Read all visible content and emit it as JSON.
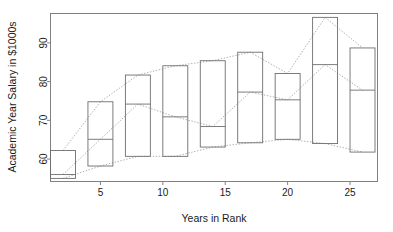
{
  "chart_data": {
    "type": "box",
    "title": "",
    "xlabel": "Years in Rank",
    "ylabel": "Academic Year Salary in $1000s",
    "xlim": [
      1,
      27.2
    ],
    "ylim": [
      54.2,
      97.6
    ],
    "xticks": [
      5,
      10,
      15,
      20,
      25
    ],
    "xtick_labels": [
      "5",
      "10",
      "15",
      "20",
      "25"
    ],
    "yticks": [
      60,
      70,
      80,
      90
    ],
    "ytick_labels": [
      "60",
      "70",
      "80",
      "90"
    ],
    "grid": false,
    "legend": "none",
    "box_width": 2.0,
    "boxes": [
      {
        "x": 2.0,
        "low": 55.0,
        "median": 56.0,
        "high": 62.2
      },
      {
        "x": 5.0,
        "low": 58.2,
        "median": 65.1,
        "high": 74.8
      },
      {
        "x": 8.0,
        "low": 60.7,
        "median": 74.2,
        "high": 81.7
      },
      {
        "x": 11.0,
        "low": 60.7,
        "median": 70.9,
        "high": 84.1
      },
      {
        "x": 14.0,
        "low": 63.1,
        "median": 68.4,
        "high": 85.4
      },
      {
        "x": 17.0,
        "low": 64.2,
        "median": 77.3,
        "high": 87.6
      },
      {
        "x": 20.0,
        "low": 65.1,
        "median": 75.3,
        "high": 82.1
      },
      {
        "x": 23.0,
        "low": 64.0,
        "median": 84.4,
        "high": 96.6
      },
      {
        "x": 26.0,
        "low": 61.8,
        "median": 77.8,
        "high": 88.7
      }
    ],
    "connector_lines": [
      {
        "name": "upper-whisker-trend",
        "style": "dotted",
        "points": [
          [
            2.0,
            62.2
          ],
          [
            5.0,
            74.8
          ],
          [
            8.0,
            81.7
          ],
          [
            11.0,
            84.1
          ],
          [
            14.0,
            85.4
          ],
          [
            17.0,
            87.6
          ],
          [
            20.0,
            82.1
          ],
          [
            23.0,
            96.6
          ],
          [
            26.0,
            88.7
          ]
        ]
      },
      {
        "name": "median-trend",
        "style": "dotted",
        "points": [
          [
            2.0,
            56.0
          ],
          [
            5.0,
            65.1
          ],
          [
            8.0,
            74.2
          ],
          [
            11.0,
            70.9
          ],
          [
            14.0,
            68.4
          ],
          [
            17.0,
            77.3
          ],
          [
            20.0,
            75.3
          ],
          [
            23.0,
            84.4
          ],
          [
            26.0,
            77.8
          ]
        ]
      },
      {
        "name": "lower-whisker-trend",
        "style": "dotted",
        "points": [
          [
            2.0,
            55.0
          ],
          [
            5.0,
            58.2
          ],
          [
            8.0,
            60.7
          ],
          [
            11.0,
            60.7
          ],
          [
            14.0,
            63.1
          ],
          [
            17.0,
            64.2
          ],
          [
            20.0,
            65.1
          ],
          [
            23.0,
            64.0
          ],
          [
            26.0,
            61.8
          ]
        ]
      }
    ],
    "colors": {
      "frame": "#808080",
      "box_stroke": "#6e6e6e",
      "line": "#9a9a9a",
      "text": "#1a1a1a",
      "background": "#ffffff"
    }
  }
}
